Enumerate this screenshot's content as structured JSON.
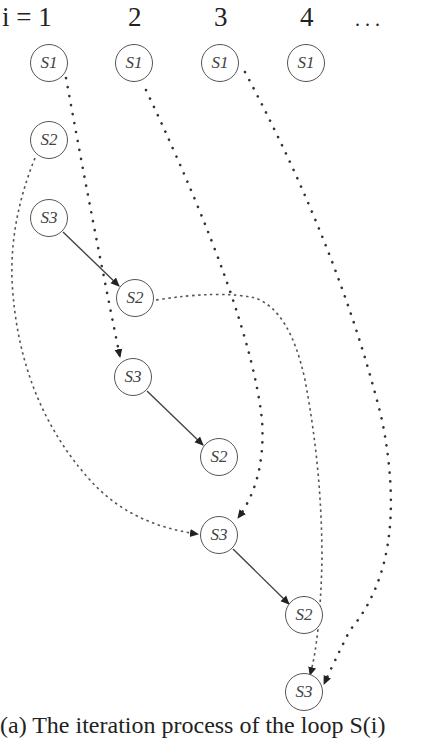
{
  "diagram": {
    "column_labels": [
      "i = 1",
      "2",
      "3",
      "4",
      ". . ."
    ],
    "nodes": [
      {
        "id": "s1_1",
        "label": "S1",
        "x": 49,
        "y": 63
      },
      {
        "id": "s1_2",
        "label": "S1",
        "x": 134,
        "y": 63
      },
      {
        "id": "s1_3",
        "label": "S1",
        "x": 220,
        "y": 63
      },
      {
        "id": "s1_4",
        "label": "S1",
        "x": 306,
        "y": 63
      },
      {
        "id": "s2_1",
        "label": "S2",
        "x": 49,
        "y": 140
      },
      {
        "id": "s3_1",
        "label": "S3",
        "x": 49,
        "y": 218
      },
      {
        "id": "s2_2",
        "label": "S2",
        "x": 135,
        "y": 298
      },
      {
        "id": "s3_2",
        "label": "S3",
        "x": 133,
        "y": 377
      },
      {
        "id": "s2_3",
        "label": "S2",
        "x": 219,
        "y": 457
      },
      {
        "id": "s3_3",
        "label": "S3",
        "x": 219,
        "y": 535
      },
      {
        "id": "s2_4",
        "label": "S2",
        "x": 304,
        "y": 615
      },
      {
        "id": "s3_4",
        "label": "S3",
        "x": 304,
        "y": 692
      }
    ],
    "edges": [
      {
        "from": "s3_1",
        "to": "s2_2",
        "style": "solid"
      },
      {
        "from": "s3_2",
        "to": "s2_3",
        "style": "solid"
      },
      {
        "from": "s3_3",
        "to": "s2_4",
        "style": "solid"
      },
      {
        "from": "s1_1",
        "to": "s3_2",
        "style": "dotted"
      },
      {
        "from": "s1_2",
        "to": "s3_3",
        "style": "dotted"
      },
      {
        "from": "s1_3",
        "to": "s3_4",
        "style": "dotted"
      },
      {
        "from": "s2_1",
        "to": "s3_3",
        "style": "dashed"
      },
      {
        "from": "s2_2",
        "to": "s3_4",
        "style": "dashed"
      }
    ],
    "caption": "(a) The iteration process of the loop S(i)"
  }
}
